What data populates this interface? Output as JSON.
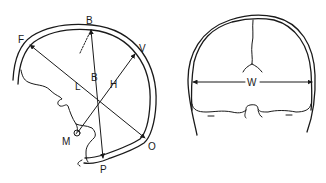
{
  "diagram": {
    "lateral_view": {
      "labels": {
        "F": "F",
        "B_top": "B",
        "V": "V",
        "L": "L",
        "B_mid": "B",
        "H": "H",
        "M": "M",
        "O": "O",
        "P": "P"
      },
      "measurements": [
        {
          "name": "L",
          "from": "F",
          "to": "O"
        },
        {
          "name": "B",
          "from": "B",
          "to": "P"
        },
        {
          "name": "H",
          "from": "M",
          "to": "V"
        }
      ]
    },
    "frontal_view": {
      "labels": {
        "W": "W"
      },
      "measurements": [
        {
          "name": "W",
          "from": "left wall",
          "to": "right wall"
        }
      ]
    },
    "colors": {
      "line": "#1a1a1a",
      "background": "#ffffff"
    }
  }
}
